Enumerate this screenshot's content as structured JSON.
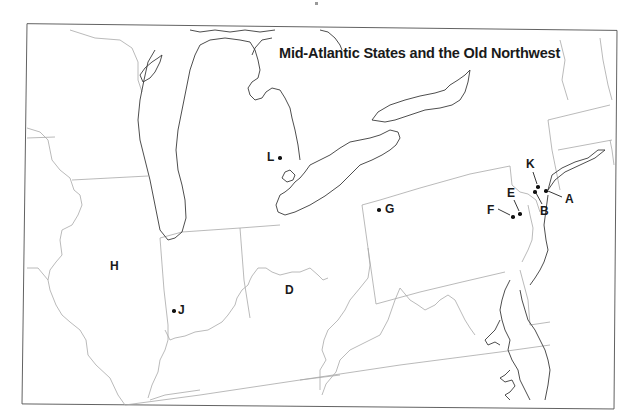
{
  "map": {
    "title": "Mid-Atlantic States and the Old Northwest",
    "colors": {
      "state_border": "#a8a8a8",
      "coastline": "#3a3a3a",
      "frame": "#555555",
      "label": "#1a1a1a"
    },
    "labels": [
      {
        "id": "A",
        "text": "A",
        "type": "point-with-leader"
      },
      {
        "id": "B",
        "text": "B",
        "type": "point-with-leader"
      },
      {
        "id": "D",
        "text": "D",
        "type": "region"
      },
      {
        "id": "E",
        "text": "E",
        "type": "point-with-leader"
      },
      {
        "id": "F",
        "text": "F",
        "type": "point-with-leader"
      },
      {
        "id": "G",
        "text": "G",
        "type": "point"
      },
      {
        "id": "H",
        "text": "H",
        "type": "point"
      },
      {
        "id": "J",
        "text": "J",
        "type": "region"
      },
      {
        "id": "K",
        "text": "K",
        "type": "point-with-leader"
      },
      {
        "id": "L",
        "text": "L",
        "type": "point"
      }
    ]
  }
}
